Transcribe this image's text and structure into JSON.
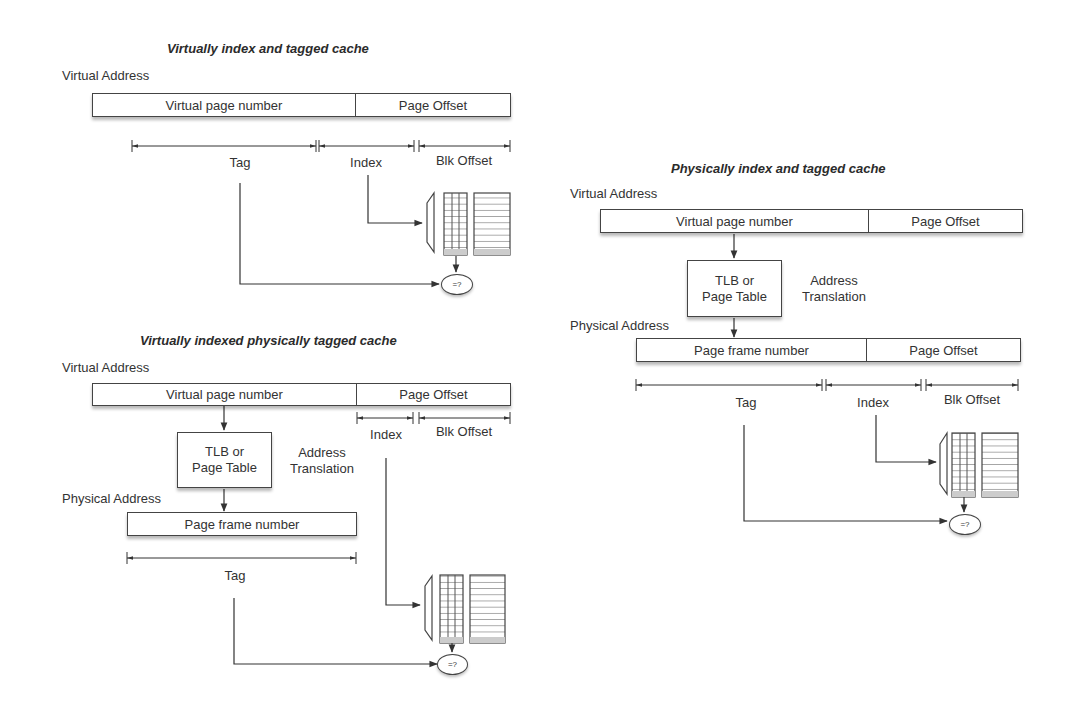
{
  "colors": {
    "line": "#444444",
    "text": "#333333",
    "background": "#ffffff",
    "shadow": "#bdbdbd"
  },
  "diagrams": [
    {
      "id": "vivt",
      "title": "Virtually index and tagged cache",
      "virtual_address_label": "Virtual Address",
      "fields": [
        "Virtual page number",
        "Page Offset"
      ],
      "dimensions": [
        "Tag",
        "Index",
        "Blk Offset"
      ],
      "comparator": "=?"
    },
    {
      "id": "vipt",
      "title": "Virtually indexed physically tagged cache",
      "virtual_address_label": "Virtual Address",
      "fields": [
        "Virtual page number",
        "Page Offset"
      ],
      "translation_box": [
        "TLB or",
        "Page Table"
      ],
      "translation_label": [
        "Address",
        "Translation"
      ],
      "physical_address_label": "Physical Address",
      "physical_fields": [
        "Page frame number"
      ],
      "dimensions": [
        "Index",
        "Blk Offset",
        "Tag"
      ],
      "comparator": "=?"
    },
    {
      "id": "pipt",
      "title": "Physically index and tagged cache",
      "virtual_address_label": "Virtual Address",
      "fields": [
        "Virtual page number",
        "Page Offset"
      ],
      "translation_box": [
        "TLB or",
        "Page Table"
      ],
      "translation_label": [
        "Address",
        "Translation"
      ],
      "physical_address_label": "Physical Address",
      "physical_fields": [
        "Page frame number",
        "Page Offset"
      ],
      "dimensions": [
        "Tag",
        "Index",
        "Blk Offset"
      ],
      "comparator": "=?"
    }
  ]
}
